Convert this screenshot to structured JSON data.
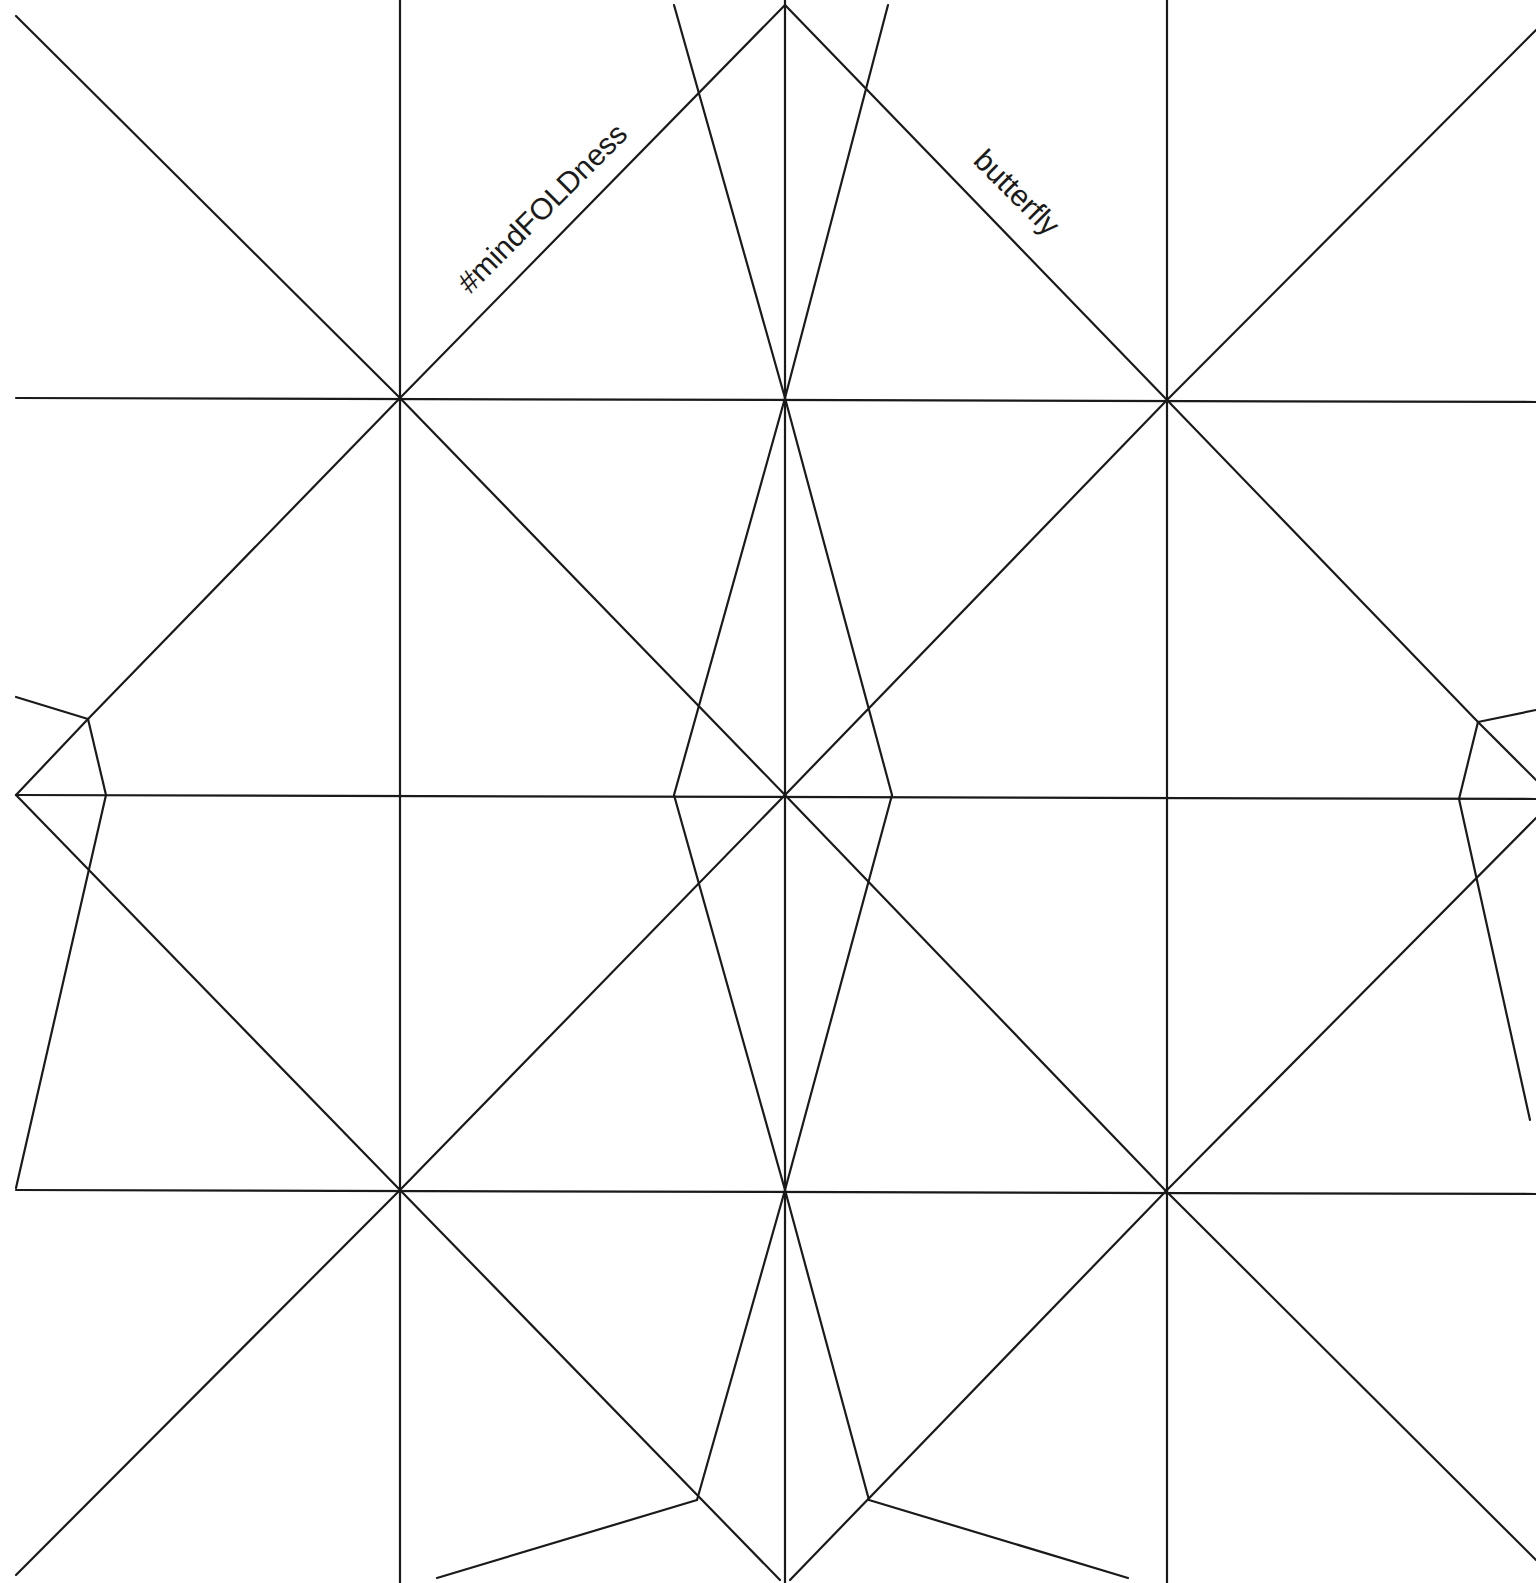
{
  "diagram": {
    "type": "origami-crease-pattern",
    "stroke_color": "#1a1a1a",
    "background": "#ffffff",
    "labels": [
      {
        "text": "#mindFOLDness",
        "x": 470,
        "y": 295,
        "rotate": -45
      },
      {
        "text": "butterfly",
        "x": 972,
        "y": 162,
        "rotate": 45
      }
    ],
    "lines": [
      [
        400,
        0,
        400,
        1583
      ],
      [
        785,
        0,
        785,
        1583
      ],
      [
        1167,
        0,
        1167,
        1583
      ],
      [
        16,
        398,
        1536,
        402
      ],
      [
        16,
        795,
        1536,
        799
      ],
      [
        16,
        1190,
        1536,
        1194
      ],
      [
        16,
        16,
        400,
        398
      ],
      [
        400,
        398,
        785,
        795
      ],
      [
        785,
        795,
        1165,
        1190
      ],
      [
        1165,
        1190,
        1536,
        1560
      ],
      [
        1536,
        30,
        1167,
        400
      ],
      [
        1167,
        400,
        785,
        795
      ],
      [
        785,
        795,
        400,
        1190
      ],
      [
        400,
        1190,
        16,
        1575
      ],
      [
        785,
        5,
        400,
        398
      ],
      [
        400,
        398,
        88,
        719
      ],
      [
        88,
        719,
        16,
        795
      ],
      [
        16,
        795,
        400,
        1190
      ],
      [
        400,
        1190,
        780,
        1580
      ],
      [
        785,
        5,
        1167,
        400
      ],
      [
        1167,
        400,
        1478,
        722
      ],
      [
        1478,
        722,
        1536,
        780
      ],
      [
        1536,
        818,
        1167,
        1190
      ],
      [
        1167,
        1190,
        790,
        1580
      ],
      [
        674,
        5,
        785,
        398
      ],
      [
        888,
        5,
        785,
        398
      ],
      [
        785,
        398,
        674,
        795
      ],
      [
        785,
        398,
        892,
        795
      ],
      [
        674,
        795,
        785,
        1190
      ],
      [
        892,
        795,
        785,
        1190
      ],
      [
        785,
        1190,
        697,
        1500
      ],
      [
        785,
        1190,
        869,
        1500
      ],
      [
        16,
        697,
        88,
        719
      ],
      [
        88,
        719,
        106,
        795
      ],
      [
        106,
        795,
        16,
        1188
      ],
      [
        1536,
        710,
        1478,
        722
      ],
      [
        1478,
        722,
        1459,
        799
      ],
      [
        1459,
        799,
        1530,
        1120
      ],
      [
        697,
        1500,
        437,
        1578
      ],
      [
        869,
        1500,
        1128,
        1578
      ]
    ]
  }
}
